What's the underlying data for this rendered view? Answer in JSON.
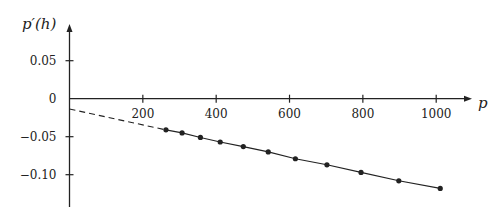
{
  "chart_data": {
    "type": "line",
    "title": "",
    "xlabel": "p",
    "ylabel": "p′(h)",
    "xlim": [
      0,
      1100
    ],
    "ylim": [
      -0.14,
      0.1
    ],
    "grid": false,
    "legend": null,
    "x_ticks": [
      200,
      400,
      600,
      800,
      1000
    ],
    "x_tick_labels": [
      "200",
      "400",
      "600",
      "800",
      "1000"
    ],
    "y_ticks": [
      0.05,
      0,
      -0.05,
      -0.1
    ],
    "y_tick_labels": [
      "0.05",
      "0",
      "−0.05",
      "−0.10"
    ],
    "series": [
      {
        "name": "data",
        "style": "solid line with markers",
        "x": [
          263,
          307,
          357,
          411,
          474,
          542,
          616,
          702,
          795,
          898,
          1011
        ],
        "y": [
          -0.041,
          -0.045,
          -0.051,
          -0.057,
          -0.063,
          -0.07,
          -0.079,
          -0.087,
          -0.097,
          -0.108,
          -0.118
        ]
      },
      {
        "name": "extrapolation",
        "style": "dashed",
        "x": [
          0,
          263
        ],
        "y": [
          -0.0136,
          -0.041
        ]
      }
    ]
  }
}
